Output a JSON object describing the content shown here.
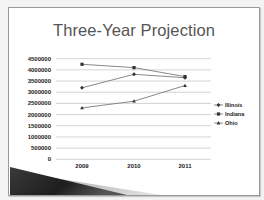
{
  "slide": {
    "title": "Three-Year Projection"
  },
  "colors": {
    "gridline": "#c8c8c8",
    "series_line": "#7a7a7a",
    "marker": "#333333",
    "title": "#555555",
    "wedge_dark": "#2a2a2a",
    "wedge_light": "#bdbdbd"
  },
  "chart_data": {
    "type": "line",
    "title": "Three-Year Projection",
    "xlabel": "",
    "ylabel": "",
    "categories": [
      "2009",
      "2010",
      "2011"
    ],
    "ylim": [
      0,
      4500000
    ],
    "yticks": [
      "4500000",
      "4000000",
      "3500000",
      "3000000",
      "2500000",
      "2000000",
      "1500000",
      "1000000",
      "500000",
      "0"
    ],
    "grid": true,
    "legend_position": "right",
    "series": [
      {
        "name": "Illinois",
        "marker": "diamond",
        "values": [
          3200000,
          3800000,
          3650000
        ]
      },
      {
        "name": "Indiana",
        "marker": "square",
        "values": [
          4250000,
          4100000,
          3700000
        ]
      },
      {
        "name": "Ohio",
        "marker": "triangle",
        "values": [
          2300000,
          2600000,
          3300000
        ]
      }
    ]
  }
}
